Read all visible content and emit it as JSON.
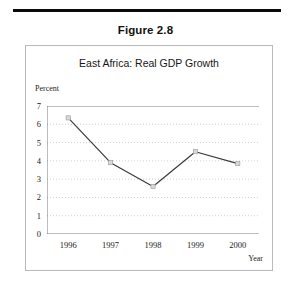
{
  "figure": {
    "caption": "Figure 2.8"
  },
  "chart_data": {
    "type": "line",
    "title": "East Africa: Real GDP Growth",
    "xlabel": "Year",
    "ylabel": "Percent",
    "categories": [
      "1996",
      "1997",
      "1998",
      "1999",
      "2000"
    ],
    "values": [
      6.35,
      3.9,
      2.6,
      4.5,
      3.85
    ],
    "series": [
      {
        "name": "Real GDP Growth",
        "values": [
          6.35,
          3.9,
          2.6,
          4.5,
          3.85
        ]
      }
    ],
    "ylim": [
      0,
      7
    ],
    "yticks": [
      "0",
      "1",
      "2",
      "3",
      "4",
      "5",
      "6",
      "7"
    ],
    "grid": "horizontal-dotted",
    "legend": "none",
    "line_color": "#3a3a3a",
    "marker_fill": "#d8d8d8",
    "marker_edge": "#9a9a9a",
    "gridline_color": "#c4c4c4",
    "axis_color": "#6e6e6e",
    "frame_color": "#b9b9b9"
  }
}
